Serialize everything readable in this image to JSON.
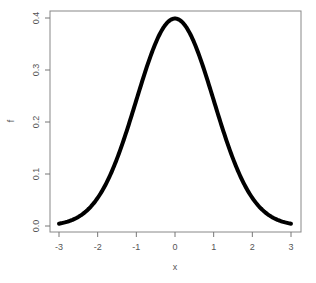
{
  "chart_data": {
    "type": "line",
    "title": "",
    "xlabel": "x",
    "ylabel": "f",
    "xlim": [
      -3.15,
      3.3
    ],
    "ylim": [
      -0.012,
      0.412
    ],
    "grid": false,
    "legend": null,
    "x_ticks": [
      -3,
      -2,
      -1,
      0,
      1,
      2,
      3
    ],
    "x_tick_labels": [
      "-3",
      "-2",
      "-1",
      "0",
      "1",
      "2",
      "3"
    ],
    "y_ticks": [
      0.0,
      0.1,
      0.2,
      0.3,
      0.4
    ],
    "y_tick_labels": [
      "0.0",
      "0.1",
      "0.2",
      "0.3",
      "0.4"
    ],
    "series": [
      {
        "name": "standard normal density",
        "color": "#000000",
        "line_width": 4,
        "x": [
          -3,
          -2.5,
          -2,
          -1.5,
          -1,
          -0.5,
          0,
          0.5,
          1,
          1.5,
          2,
          2.5,
          3
        ],
        "values": [
          0.0044,
          0.0175,
          0.054,
          0.1295,
          0.242,
          0.3521,
          0.3989,
          0.3521,
          0.242,
          0.1295,
          0.054,
          0.0175,
          0.0044
        ]
      }
    ]
  },
  "colors": {
    "curve": "#000000",
    "axis": "#777777",
    "frame": "#888888",
    "text": "#555555",
    "background": "#ffffff"
  }
}
